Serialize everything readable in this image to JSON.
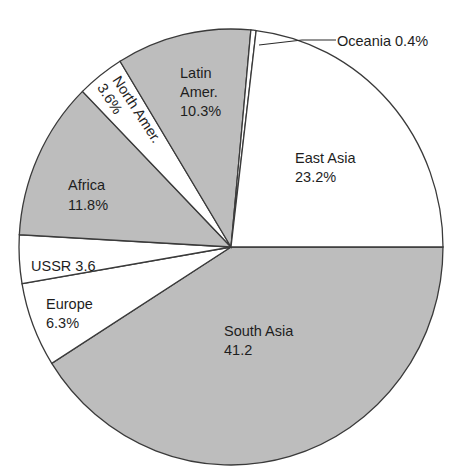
{
  "chart_data": {
    "type": "pie",
    "title": "",
    "start_angle_deg": 0,
    "direction": "clockwise",
    "slices": [
      {
        "name": "South Asia",
        "value": 41.2,
        "label_lines": [
          "South Asia",
          "41.2"
        ],
        "fill": "#bdbdbd"
      },
      {
        "name": "Europe",
        "value": 6.3,
        "label_lines": [
          "Europe",
          "6.3%"
        ],
        "fill": "#ffffff"
      },
      {
        "name": "USSR",
        "value": 3.6,
        "label_lines": [
          "USSR 3.6"
        ],
        "fill": "#ffffff"
      },
      {
        "name": "Africa",
        "value": 11.8,
        "label_lines": [
          "Africa",
          "11.8%"
        ],
        "fill": "#bdbdbd"
      },
      {
        "name": "North Amer.",
        "value": 3.6,
        "label_lines": [
          "North Amer.",
          "3.6%"
        ],
        "fill": "#ffffff"
      },
      {
        "name": "Latin Amer.",
        "value": 10.3,
        "label_lines": [
          "Latin",
          "Amer.",
          "10.3%"
        ],
        "fill": "#bdbdbd"
      },
      {
        "name": "Oceania",
        "value": 0.4,
        "label_lines": [
          "Oceania 0.4%"
        ],
        "fill": "#ffffff"
      },
      {
        "name": "East Asia",
        "value": 23.2,
        "label_lines": [
          "East Asia",
          "23.2%"
        ],
        "fill": "#ffffff"
      }
    ],
    "unit": "%",
    "legend": "none (labels inside slices)",
    "colors": {
      "shaded": "#bdbdbd",
      "unshaded": "#ffffff",
      "outline": "#3a3a3a"
    }
  },
  "labels": {
    "south_asia": {
      "line1": "South Asia",
      "line2": "41.2"
    },
    "europe": {
      "line1": "Europe",
      "line2": "6.3%"
    },
    "ussr": {
      "line1": "USSR 3.6"
    },
    "africa": {
      "line1": "Africa",
      "line2": "11.8%"
    },
    "north_amer": {
      "line1": "North Amer.",
      "line2": "3.6%"
    },
    "latin_amer": {
      "line1": "Latin",
      "line2": "Amer.",
      "line3": "10.3%"
    },
    "oceania": {
      "line1": "Oceania 0.4%"
    },
    "east_asia": {
      "line1": "East Asia",
      "line2": "23.2%"
    }
  }
}
